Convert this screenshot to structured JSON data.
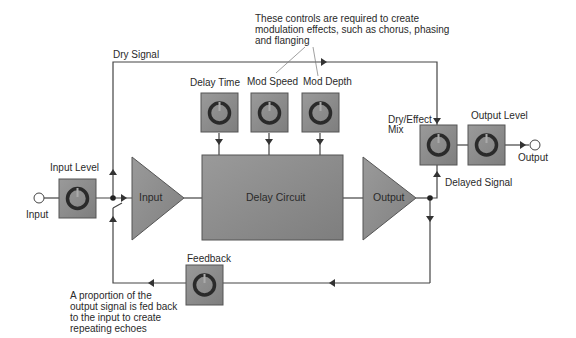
{
  "colors": {
    "block_fill": "#8a8a8a",
    "knob_box_fill": "#8c8c8c",
    "line": "#444444",
    "text": "#2a2a2a",
    "background": "#ffffff"
  },
  "annotations": {
    "modulation_note": "These controls are required to create modulation effects, such as chorus, phasing and flanging",
    "feedback_note": "A proportion of the output signal is fed back to the input to create repeating echoes"
  },
  "signals": {
    "dry_signal": "Dry Signal",
    "delayed_signal": "Delayed Signal"
  },
  "ports": {
    "input": "Input",
    "output": "Output"
  },
  "controls": {
    "input_level": "Input Level",
    "delay_time": "Delay Time",
    "mod_speed": "Mod Speed",
    "mod_depth": "Mod Depth",
    "dry_effect_mix_line1": "Dry/Effect",
    "dry_effect_mix_line2": "Mix",
    "output_level": "Output Level",
    "feedback": "Feedback"
  },
  "blocks": {
    "input_amp": "Input",
    "delay_circuit": "Delay Circuit",
    "output_amp": "Output"
  },
  "icons": {
    "knob": "knob-icon",
    "port": "port-circle-icon",
    "arrow": "arrowhead-icon",
    "junction": "junction-dot-icon"
  }
}
